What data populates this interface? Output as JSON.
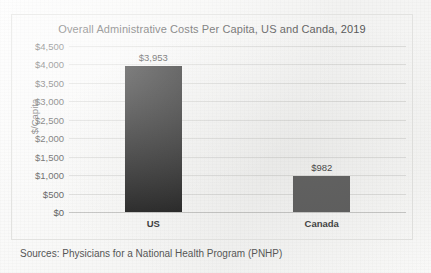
{
  "chart_data": {
    "type": "bar",
    "title": "Overall Administrative Costs Per Capita, US and Canda, 2019",
    "xlabel": "",
    "ylabel": "$/Capita",
    "categories": [
      "US",
      "Canada"
    ],
    "values": [
      3953,
      982
    ],
    "value_labels": [
      "$3,953",
      "$982"
    ],
    "bar_colors": [
      "#262626",
      "#595959"
    ],
    "ylim": [
      0,
      4500
    ],
    "ytick_values": [
      4500,
      4000,
      3500,
      3000,
      2500,
      2000,
      1500,
      1000,
      500,
      0
    ],
    "ytick_labels": [
      "$4,500",
      "$4,000",
      "$3,500",
      "$3,000",
      "$2,500",
      "$2,000",
      "$1,500",
      "$1,000",
      "$500",
      "$0"
    ],
    "grid": true,
    "legend": "none",
    "source_note": "Sources: Physicians for a National Health Program (PNHP)"
  }
}
